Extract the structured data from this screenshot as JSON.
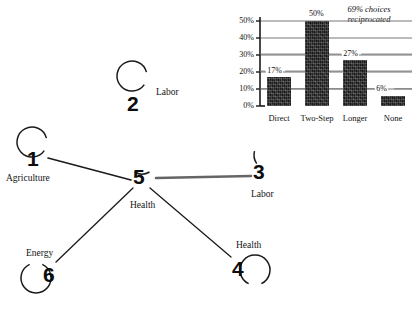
{
  "graph": {
    "nodes": [
      {
        "id": "1",
        "number": "1",
        "label": "Agriculture",
        "cx": 36,
        "cy": 154,
        "loop": "top-left",
        "num_x": 27,
        "num_y": 148,
        "lab_x": 6,
        "lab_y": 174
      },
      {
        "id": "2",
        "number": "2",
        "label": "Labor",
        "cx": 136,
        "cy": 88,
        "loop": "top-left",
        "num_x": 127,
        "num_y": 93,
        "lab_x": 156,
        "lab_y": 88
      },
      {
        "id": "3",
        "number": "3",
        "label": "Labor",
        "cx": 262,
        "cy": 167,
        "loop": "top-right",
        "num_x": 253,
        "num_y": 161,
        "lab_x": 251,
        "lab_y": 190
      },
      {
        "id": "4",
        "number": "4",
        "label": "Health",
        "cx": 243,
        "cy": 268,
        "loop": "right",
        "num_x": 232,
        "num_y": 258,
        "lab_x": 236,
        "lab_y": 241
      },
      {
        "id": "5",
        "number": "5",
        "label": "Health",
        "cx": 141,
        "cy": 172,
        "loop": "top",
        "num_x": 133,
        "num_y": 166,
        "lab_x": 130,
        "lab_y": 201
      },
      {
        "id": "6",
        "number": "6",
        "label": "Energy",
        "cx": 47,
        "cy": 275,
        "loop": "left",
        "num_x": 43,
        "num_y": 264,
        "lab_x": 26,
        "lab_y": 249
      }
    ],
    "edges": [
      {
        "from": "1",
        "to": "5",
        "x1": 48,
        "y1": 158,
        "x2": 131,
        "y2": 180,
        "width": 1.6,
        "color": "#1b1b1b"
      },
      {
        "from": "5",
        "to": "3",
        "x1": 156,
        "y1": 178,
        "x2": 251,
        "y2": 176,
        "width": 2.6,
        "color": "#656565"
      },
      {
        "from": "5",
        "to": "6",
        "x1": 133,
        "y1": 188,
        "x2": 56,
        "y2": 262,
        "width": 1.3,
        "color": "#1b1b1b"
      },
      {
        "from": "5",
        "to": "4",
        "x1": 150,
        "y1": 188,
        "x2": 231,
        "y2": 257,
        "width": 1.3,
        "color": "#1b1b1b"
      }
    ],
    "loop_radius": 15,
    "stroke_color": "#1b1b1b"
  },
  "chart_data": {
    "type": "bar",
    "title": "",
    "note": "69% choices reciprocated",
    "categories": [
      "Direct",
      "Two-Step",
      "Longer",
      "None"
    ],
    "values": [
      17,
      50,
      27,
      6
    ],
    "value_labels": [
      "17%",
      "50%",
      "27%",
      "6%"
    ],
    "xlabel": "",
    "ylabel": "",
    "ylim": [
      0,
      50
    ],
    "yticks": [
      0,
      10,
      20,
      30,
      40,
      50
    ],
    "ytick_labels": [
      "0%",
      "10%",
      "20%",
      "30%",
      "40%",
      "50%"
    ],
    "grid": true,
    "legend": "none",
    "bar_color": "#1a1a1a",
    "grid_color": "#777777",
    "axis_color": "#1b1b1b"
  }
}
